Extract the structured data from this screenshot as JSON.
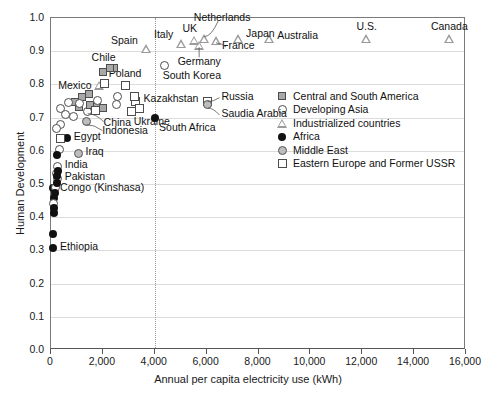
{
  "chart_data": {
    "type": "scatter",
    "title": "",
    "xlabel": "Annual per capita electricity use (kWh)",
    "ylabel": "Human Development",
    "xlim": [
      0,
      16000
    ],
    "ylim": [
      0.0,
      1.0
    ],
    "xticks": [
      "0",
      "2,000",
      "4,000",
      "6,000",
      "8,000",
      "10,000",
      "12,000",
      "14,000",
      "16,000"
    ],
    "xtick_values": [
      0,
      2000,
      4000,
      6000,
      8000,
      10000,
      12000,
      14000,
      16000
    ],
    "yticks": [
      "0.0",
      "0.1",
      "0.2",
      "0.3",
      "0.4",
      "0.5",
      "0.6",
      "0.7",
      "0.8",
      "0.9",
      "1.0"
    ],
    "ytick_values": [
      0.0,
      0.1,
      0.2,
      0.3,
      0.4,
      0.5,
      0.6,
      0.7,
      0.8,
      0.9,
      1.0
    ],
    "grid": "horizontal",
    "reference_line": {
      "x": 4000,
      "style": "dotted",
      "orientation": "vertical"
    },
    "legend_position": "center-right",
    "legend": [
      {
        "key": "central_south_america",
        "label": "Central and South America",
        "marker": "filled-grey-square",
        "color": "#a8a8a8"
      },
      {
        "key": "developing_asia",
        "label": "Developing Asia",
        "marker": "open-circle",
        "color": "#ffffff"
      },
      {
        "key": "industrialized",
        "label": "Industrialized countries",
        "marker": "open-triangle",
        "color": "#9a9a9a"
      },
      {
        "key": "africa",
        "label": "Africa",
        "marker": "filled-black-circle",
        "color": "#111111"
      },
      {
        "key": "middle_east",
        "label": "Middle East",
        "marker": "grey-ringed-circle",
        "color": "#bdbdbd"
      },
      {
        "key": "eastern_europe_fsu",
        "label": "Eastern Europe and Former USSR",
        "marker": "open-square",
        "color": "#ffffff"
      }
    ],
    "points": [
      {
        "label": "Canada",
        "x": 15400,
        "y": 0.935,
        "group": "industrialized",
        "label_dx": 0,
        "label_dy": -13,
        "label_align": "center"
      },
      {
        "label": "U.S.",
        "x": 12200,
        "y": 0.935,
        "group": "industrialized",
        "label_dx": 0,
        "label_dy": -13,
        "label_align": "center"
      },
      {
        "label": "Australia",
        "x": 8450,
        "y": 0.935,
        "group": "industrialized",
        "label_dx": 8,
        "label_dy": -4,
        "label_align": "left"
      },
      {
        "label": "Japan",
        "x": 7250,
        "y": 0.935,
        "group": "industrialized",
        "label_dx": 8,
        "label_dy": -6,
        "label_align": "left"
      },
      {
        "label": "France",
        "x": 6400,
        "y": 0.928,
        "group": "industrialized",
        "label_dx": 6,
        "label_dy": 4,
        "label_align": "left"
      },
      {
        "label": "Netherlands",
        "x": 5950,
        "y": 0.935,
        "group": "industrialized",
        "label_dx": 18,
        "label_dy": -22,
        "label_align": "center"
      },
      {
        "label": "Germany",
        "x": 5750,
        "y": 0.915,
        "group": "industrialized",
        "label_dx": 0,
        "label_dy": 16,
        "label_align": "center"
      },
      {
        "label": "UK",
        "x": 5550,
        "y": 0.93,
        "group": "industrialized",
        "label_dx": -4,
        "label_dy": -12,
        "label_align": "center"
      },
      {
        "label": "Italy",
        "x": 5050,
        "y": 0.92,
        "group": "industrialized",
        "label_dx": -8,
        "label_dy": -10,
        "label_align": "right"
      },
      {
        "label": "South Korea",
        "x": 4420,
        "y": 0.855,
        "group": "developing_asia",
        "label_dx": -2,
        "label_dy": 10,
        "label_align": "left"
      },
      {
        "label": "Spain",
        "x": 3700,
        "y": 0.905,
        "group": "industrialized",
        "label_dx": -8,
        "label_dy": -9,
        "label_align": "right"
      },
      {
        "label": "Russia",
        "x": 6070,
        "y": 0.745,
        "group": "eastern_europe_fsu",
        "label_dx": 14,
        "label_dy": -6,
        "label_align": "left"
      },
      {
        "label": "Saudia Arabia",
        "x": 6070,
        "y": 0.735,
        "group": "middle_east",
        "label_dx": 14,
        "label_dy": 8,
        "label_align": "left"
      },
      {
        "label": "South Africa",
        "x": 4050,
        "y": 0.695,
        "group": "africa",
        "label_dx": 4,
        "label_dy": 9,
        "label_align": "left"
      },
      {
        "label": "Kazakhstan",
        "x": 3300,
        "y": 0.745,
        "group": "eastern_europe_fsu",
        "label_dx": 8,
        "label_dy": -4,
        "label_align": "left"
      },
      {
        "label": "Ukraine",
        "x": 3150,
        "y": 0.715,
        "group": "eastern_europe_fsu",
        "label_dx": 2,
        "label_dy": 9,
        "label_align": "left"
      },
      {
        "label": "Poland",
        "x": 2900,
        "y": 0.795,
        "group": "eastern_europe_fsu",
        "label_dx": 0,
        "label_dy": -12,
        "label_align": "center"
      },
      {
        "label": "Chile",
        "x": 2450,
        "y": 0.845,
        "group": "central_south_america",
        "label_dx": -10,
        "label_dy": -11,
        "label_align": "center"
      },
      {
        "label": "Mexico",
        "x": 1900,
        "y": 0.795,
        "group": "industrialized",
        "label_dx": -8,
        "label_dy": 0,
        "label_align": "right"
      },
      {
        "label": "China",
        "x": 1450,
        "y": 0.715,
        "group": "developing_asia",
        "label_dx": 16,
        "label_dy": 10,
        "label_align": "left"
      },
      {
        "label": "Indonesia",
        "x": 1400,
        "y": 0.685,
        "group": "middle_east",
        "label_dx": 16,
        "label_dy": 8,
        "label_align": "left"
      },
      {
        "label": "Iraq",
        "x": 1100,
        "y": 0.59,
        "group": "middle_east",
        "label_dx": 7,
        "label_dy": -2,
        "label_align": "left"
      },
      {
        "label": "Egypt",
        "x": 650,
        "y": 0.635,
        "group": "africa",
        "label_dx": 7,
        "label_dy": -2,
        "label_align": "left"
      },
      {
        "label": "India",
        "x": 300,
        "y": 0.55,
        "group": "developing_asia",
        "label_dx": 7,
        "label_dy": -2,
        "label_align": "left"
      },
      {
        "label": "Pakistan",
        "x": 300,
        "y": 0.515,
        "group": "developing_asia",
        "label_dx": 7,
        "label_dy": -2,
        "label_align": "left"
      },
      {
        "label": "Congo (Kinshasa)",
        "x": 120,
        "y": 0.485,
        "group": "africa",
        "label_dx": 7,
        "label_dy": -1,
        "label_align": "left"
      },
      {
        "label": "Ethiopia",
        "x": 120,
        "y": 0.305,
        "group": "africa",
        "label_dx": 7,
        "label_dy": -2,
        "label_align": "left"
      },
      {
        "label": "",
        "x": 2300,
        "y": 0.845,
        "group": "central_south_america"
      },
      {
        "label": "",
        "x": 2050,
        "y": 0.835,
        "group": "central_south_america"
      },
      {
        "label": "",
        "x": 1500,
        "y": 0.768,
        "group": "central_south_america"
      },
      {
        "label": "",
        "x": 1250,
        "y": 0.758,
        "group": "central_south_america"
      },
      {
        "label": "",
        "x": 1550,
        "y": 0.735,
        "group": "central_south_america"
      },
      {
        "label": "",
        "x": 1800,
        "y": 0.73,
        "group": "central_south_america"
      },
      {
        "label": "",
        "x": 2050,
        "y": 0.725,
        "group": "central_south_america"
      },
      {
        "label": "",
        "x": 950,
        "y": 0.745,
        "group": "central_south_america"
      },
      {
        "label": "",
        "x": 1100,
        "y": 0.73,
        "group": "central_south_america"
      },
      {
        "label": "",
        "x": 2600,
        "y": 0.76,
        "group": "developing_asia"
      },
      {
        "label": "",
        "x": 2550,
        "y": 0.735,
        "group": "developing_asia"
      },
      {
        "label": "",
        "x": 1850,
        "y": 0.748,
        "group": "developing_asia"
      },
      {
        "label": "",
        "x": 1150,
        "y": 0.74,
        "group": "developing_asia"
      },
      {
        "label": "",
        "x": 700,
        "y": 0.742,
        "group": "developing_asia"
      },
      {
        "label": "",
        "x": 400,
        "y": 0.725,
        "group": "developing_asia"
      },
      {
        "label": "",
        "x": 600,
        "y": 0.705,
        "group": "developing_asia"
      },
      {
        "label": "",
        "x": 900,
        "y": 0.7,
        "group": "developing_asia"
      },
      {
        "label": "",
        "x": 400,
        "y": 0.675,
        "group": "developing_asia"
      },
      {
        "label": "",
        "x": 250,
        "y": 0.665,
        "group": "developing_asia"
      },
      {
        "label": "",
        "x": 350,
        "y": 0.6,
        "group": "developing_asia"
      },
      {
        "label": "",
        "x": 250,
        "y": 0.53,
        "group": "developing_asia"
      },
      {
        "label": "",
        "x": 2100,
        "y": 0.8,
        "group": "eastern_europe_fsu"
      },
      {
        "label": "",
        "x": 3250,
        "y": 0.76,
        "group": "eastern_europe_fsu"
      },
      {
        "label": "",
        "x": 3450,
        "y": 0.725,
        "group": "eastern_europe_fsu"
      },
      {
        "label": "",
        "x": 1750,
        "y": 0.718,
        "group": "eastern_europe_fsu"
      },
      {
        "label": "",
        "x": 420,
        "y": 0.635,
        "group": "eastern_europe_fsu"
      },
      {
        "label": "",
        "x": 200,
        "y": 0.485,
        "group": "developing_asia"
      },
      {
        "label": "",
        "x": 180,
        "y": 0.47,
        "group": "africa"
      },
      {
        "label": "",
        "x": 160,
        "y": 0.455,
        "group": "africa"
      },
      {
        "label": "",
        "x": 150,
        "y": 0.438,
        "group": "developing_asia"
      },
      {
        "label": "",
        "x": 150,
        "y": 0.425,
        "group": "africa"
      },
      {
        "label": "",
        "x": 140,
        "y": 0.41,
        "group": "africa"
      },
      {
        "label": "",
        "x": 130,
        "y": 0.345,
        "group": "africa"
      },
      {
        "label": "",
        "x": 280,
        "y": 0.585,
        "group": "africa"
      },
      {
        "label": "",
        "x": 300,
        "y": 0.535,
        "group": "africa"
      },
      {
        "label": "",
        "x": 280,
        "y": 0.52,
        "group": "africa"
      },
      {
        "label": "",
        "x": 260,
        "y": 0.5,
        "group": "africa"
      }
    ]
  }
}
